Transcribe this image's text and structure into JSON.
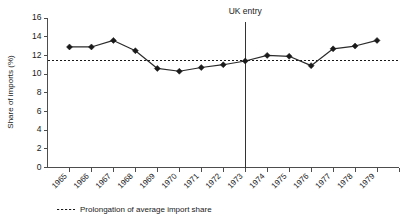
{
  "chart_data": {
    "type": "line",
    "title": "",
    "xlabel": "",
    "ylabel": "Share of imports (%)",
    "categories": [
      "1965",
      "1966",
      "1967",
      "1968",
      "1969",
      "1970",
      "1971",
      "1972",
      "1973",
      "1974",
      "1975",
      "1976",
      "1977",
      "1978",
      "1979"
    ],
    "values": [
      12.9,
      12.9,
      13.6,
      12.5,
      10.6,
      10.3,
      10.7,
      11.0,
      11.4,
      12.0,
      11.9,
      10.9,
      12.7,
      13.0,
      13.6
    ],
    "series": [
      {
        "name": "Share of imports",
        "values": [
          12.9,
          12.9,
          13.6,
          12.5,
          10.6,
          10.3,
          10.7,
          11.0,
          11.4,
          12.0,
          11.9,
          10.9,
          12.7,
          13.0,
          13.6
        ]
      }
    ],
    "ylim": [
      0,
      16
    ],
    "yticks": [
      0,
      2,
      4,
      6,
      8,
      10,
      12,
      14,
      16
    ],
    "ytick_labels": [
      "0",
      "2",
      "4",
      "6",
      "8",
      "10",
      "12",
      "14",
      "16"
    ],
    "xtick_labels": [
      "1965",
      "1966",
      "1967",
      "1968",
      "1969",
      "1970",
      "1971",
      "1972",
      "1973",
      "1974",
      "1975",
      "1976",
      "1977",
      "1978",
      "1979"
    ],
    "grid": false,
    "legend_position": "bottom-left",
    "marker": "diamond",
    "annotations": [
      {
        "kind": "vertical-line",
        "label": "UK entry",
        "at_category": "1973"
      },
      {
        "kind": "horizontal-dashed-line",
        "label": "Prolongation of average import share",
        "value": 11.5
      }
    ],
    "legend": [
      {
        "label": "Prolongation of average import share",
        "style": "dashed"
      }
    ]
  },
  "axes": {
    "y_title": "Share of imports (%)"
  },
  "annotation": {
    "uk_entry_label": "UK entry"
  },
  "legend": {
    "entry_label": "Prolongation of average import share"
  }
}
